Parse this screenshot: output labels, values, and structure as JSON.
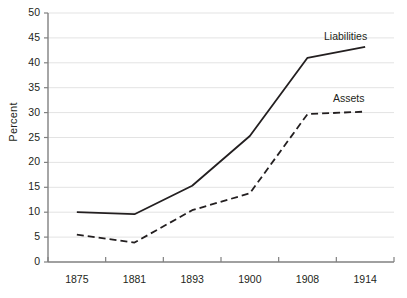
{
  "chart_data": {
    "type": "line",
    "title": "",
    "subtitle": "",
    "xlabel": "",
    "ylabel": "Percent",
    "categories": [
      "1875",
      "1881",
      "1893",
      "1900",
      "1908",
      "1914"
    ],
    "x_tick_labels": [
      "1875",
      "1881",
      "1893",
      "1900",
      "1908",
      "1914"
    ],
    "y_tick_labels": [
      "0",
      "5",
      "10",
      "15",
      "20",
      "25",
      "30",
      "35",
      "40",
      "45",
      "50"
    ],
    "y_ticks": [
      0,
      5,
      10,
      15,
      20,
      25,
      30,
      35,
      40,
      45,
      50
    ],
    "ylim": [
      0,
      50
    ],
    "grid": "horizontal",
    "legend_position": "inline-annotations",
    "series": [
      {
        "name": "Liabilities",
        "style": "solid",
        "color": "#231f20",
        "values": [
          10.0,
          9.6,
          15.3,
          25.3,
          41.0,
          43.2
        ],
        "label_text": "Liabilities"
      },
      {
        "name": "Assets",
        "style": "dashed",
        "color": "#231f20",
        "values": [
          5.5,
          3.9,
          10.4,
          13.8,
          29.7,
          30.2
        ],
        "label_text": "Assets"
      }
    ],
    "annotations": [
      {
        "text": "Liabilities",
        "series": "Liabilities"
      },
      {
        "text": "Assets",
        "series": "Assets"
      }
    ],
    "colors": {
      "background": "#ffffff",
      "grid": "#e3e3e3",
      "axis": "#808080",
      "line": "#231f20",
      "text": "#231f20"
    }
  },
  "axis": {
    "y_title": "Percent"
  },
  "labels": {
    "liabilities": "Liabilities",
    "assets": "Assets"
  }
}
